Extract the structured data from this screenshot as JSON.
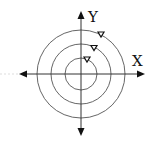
{
  "diagram": {
    "type": "concentric-circles-on-axes",
    "axes": {
      "x_label": "X",
      "y_label": "Y"
    },
    "circles": [
      {
        "name": "inner",
        "radius": 16
      },
      {
        "name": "middle",
        "radius": 30
      },
      {
        "name": "outer",
        "radius": 44
      }
    ],
    "direction_markers": [
      {
        "circle": "inner",
        "shape": "triangle-down"
      },
      {
        "circle": "middle",
        "shape": "triangle-down"
      },
      {
        "circle": "outer",
        "shape": "triangle-down"
      }
    ],
    "colors": {
      "line": "#333333",
      "circle": "#555555",
      "background": "#ffffff"
    }
  }
}
